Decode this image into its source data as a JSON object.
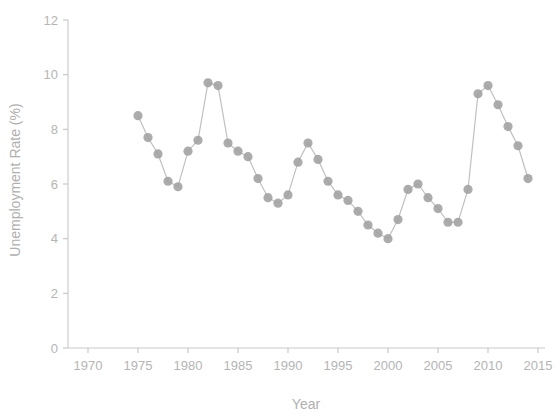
{
  "chart_data": {
    "type": "line",
    "title": "",
    "subtitle": "",
    "xlabel": "Year",
    "ylabel": "Unemployment Rate (%)",
    "xlim": [
      1970,
      2016
    ],
    "ylim": [
      0,
      12
    ],
    "xticks": [
      1970,
      1975,
      1980,
      1985,
      1990,
      1995,
      2000,
      2005,
      2010,
      2015
    ],
    "yticks": [
      0,
      2,
      4,
      6,
      8,
      10,
      12
    ],
    "xtick_labels": [
      "1970",
      "1975",
      "1980",
      "1985",
      "1990",
      "1995",
      "2000",
      "2005",
      "2010",
      "2015"
    ],
    "ytick_labels": [
      "0",
      "2",
      "4",
      "6",
      "8",
      "10",
      "12"
    ],
    "grid": false,
    "legend": null,
    "marker": "circle",
    "marker_color": "#a0a0a0",
    "line_color": "#c0c0c0",
    "x": [
      1975,
      1976,
      1977,
      1978,
      1979,
      1980,
      1981,
      1982,
      1983,
      1984,
      1985,
      1986,
      1987,
      1988,
      1989,
      1990,
      1991,
      1992,
      1993,
      1994,
      1995,
      1996,
      1997,
      1998,
      1999,
      2000,
      2001,
      2002,
      2003,
      2004,
      2005,
      2006,
      2007,
      2008,
      2009,
      2010,
      2011,
      2012,
      2013,
      2014
    ],
    "values": [
      8.5,
      7.7,
      7.1,
      6.1,
      5.9,
      7.2,
      7.6,
      9.7,
      9.6,
      7.5,
      7.2,
      7.0,
      6.2,
      5.5,
      5.3,
      5.6,
      6.8,
      7.5,
      6.9,
      6.1,
      5.6,
      5.4,
      5.0,
      4.5,
      4.2,
      4.0,
      4.7,
      5.8,
      6.0,
      5.5,
      5.1,
      4.6,
      4.6,
      5.8,
      9.3,
      9.6,
      8.9,
      8.1,
      7.4,
      6.2
    ],
    "series": [
      {
        "name": "Unemployment Rate",
        "values": [
          8.5,
          7.7,
          7.1,
          6.1,
          5.9,
          7.2,
          7.6,
          9.7,
          9.6,
          7.5,
          7.2,
          7.0,
          6.2,
          5.5,
          5.3,
          5.6,
          6.8,
          7.5,
          6.9,
          6.1,
          5.6,
          5.4,
          5.0,
          4.5,
          4.2,
          4.0,
          4.7,
          5.8,
          6.0,
          5.5,
          5.1,
          4.6,
          4.6,
          5.8,
          9.3,
          9.6,
          8.9,
          8.1,
          7.4,
          6.2
        ]
      }
    ]
  }
}
